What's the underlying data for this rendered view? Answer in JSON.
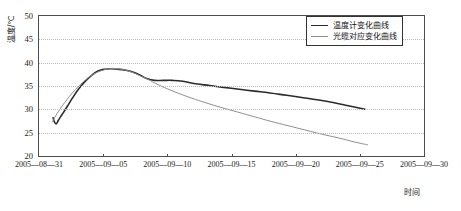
{
  "chart_data": {
    "type": "line",
    "title": "",
    "xlabel": "时间",
    "ylabel": "温度/℃",
    "grid": true,
    "legend_position": "top-right",
    "ylim": [
      20,
      50
    ],
    "yticks": [
      20,
      25,
      30,
      35,
      40,
      45,
      50
    ],
    "xlim": [
      "2005-08-31",
      "2005-09-30"
    ],
    "xticks": [
      "2005-08-31",
      "2005-09-05",
      "2005-09-10",
      "2005-09-15",
      "2005-09-20",
      "2005-09-25",
      "2005-09-30"
    ],
    "x_days_from_start": [
      0,
      5,
      10,
      15,
      20,
      25,
      30
    ],
    "series": [
      {
        "name": "温度计变化曲线",
        "color": "#2b2b2b",
        "width": 1.6,
        "x": [
          1.1,
          1.2,
          1.35,
          1.5,
          1.7,
          1.9,
          2.2,
          2.6,
          3.1,
          3.6,
          4.1,
          4.6,
          5.1,
          5.6,
          6.1,
          6.7,
          7.3,
          7.9,
          8.4,
          9.0,
          9.7,
          10.4,
          11.2,
          12.2,
          13.3,
          14.4,
          15.6,
          16.8,
          18.0,
          19.3,
          20.6,
          21.8,
          23.0,
          24.2,
          25.4
        ],
        "y": [
          28.2,
          27.3,
          26.9,
          27.6,
          28.5,
          29.3,
          30.6,
          32.4,
          34.4,
          36.0,
          37.3,
          38.2,
          38.6,
          38.7,
          38.6,
          38.4,
          38.0,
          37.3,
          36.6,
          36.2,
          36.2,
          36.2,
          36.0,
          35.5,
          35.1,
          34.7,
          34.3,
          33.9,
          33.5,
          33.0,
          32.5,
          32.0,
          31.4,
          30.7,
          30.0
        ]
      },
      {
        "name": "光缆对应变化曲线",
        "color": "#8e8e8e",
        "width": 1.0,
        "x": [
          1.05,
          1.3,
          1.7,
          2.1,
          2.5,
          3.0,
          3.5,
          4.0,
          4.5,
          5.0,
          5.5,
          6.0,
          6.6,
          7.2,
          7.8,
          8.5,
          9.2,
          10.0,
          10.9,
          11.9,
          13.0,
          14.2,
          15.5,
          16.8,
          18.1,
          19.4,
          20.7,
          22.0,
          23.3,
          24.6,
          25.6
        ],
        "y": [
          27.3,
          28.6,
          30.3,
          31.8,
          33.2,
          34.7,
          36.0,
          37.1,
          37.9,
          38.4,
          38.7,
          38.7,
          38.5,
          38.0,
          37.3,
          36.4,
          35.4,
          34.4,
          33.4,
          32.4,
          31.4,
          30.4,
          29.4,
          28.4,
          27.4,
          26.5,
          25.6,
          24.7,
          23.9,
          23.0,
          22.4
        ]
      }
    ]
  },
  "legend": {
    "items": [
      {
        "label": "温度计变化曲线",
        "color": "#2b2b2b"
      },
      {
        "label": "光缆对应变化曲线",
        "color": "#8e8e8e"
      }
    ]
  },
  "axes": {
    "y_title": "温度/℃",
    "x_title": "时间",
    "y_labels": [
      "50",
      "45",
      "40",
      "35",
      "30",
      "25",
      "20"
    ],
    "x_labels": [
      "2005-08-31",
      "2005-09-05",
      "2005-09-10",
      "2005-09-15",
      "2005-09-20",
      "2005-09-25",
      "2005-09-30"
    ]
  }
}
